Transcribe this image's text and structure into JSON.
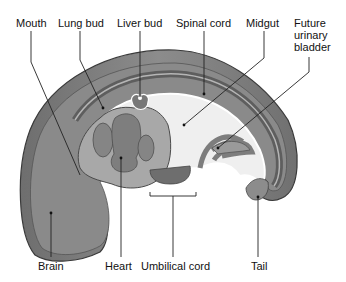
{
  "diagram": {
    "labels_top": [
      {
        "id": "mouth",
        "text": "Mouth"
      },
      {
        "id": "lung-bud",
        "text": "Lung bud"
      },
      {
        "id": "liver-bud",
        "text": "Liver bud"
      },
      {
        "id": "spinal-cord",
        "text": "Spinal cord"
      },
      {
        "id": "midgut",
        "text": "Midgut"
      },
      {
        "id": "future-urinary-bladder",
        "text": "Future urinary bladder"
      }
    ],
    "labels_bottom": [
      {
        "id": "brain",
        "text": "Brain"
      },
      {
        "id": "heart",
        "text": "Heart"
      },
      {
        "id": "umbilical-cord",
        "text": "Umbilical cord"
      },
      {
        "id": "tail",
        "text": "Tail"
      }
    ],
    "colors": {
      "outer_tissue": "#7a7a7a",
      "mid_tissue": "#9a9a9a",
      "light_tissue": "#d8d8d8",
      "cavity": "#f2f2f2",
      "heart": "#808080",
      "outline": "#3a3a3a",
      "leader_line": "#222222"
    }
  }
}
